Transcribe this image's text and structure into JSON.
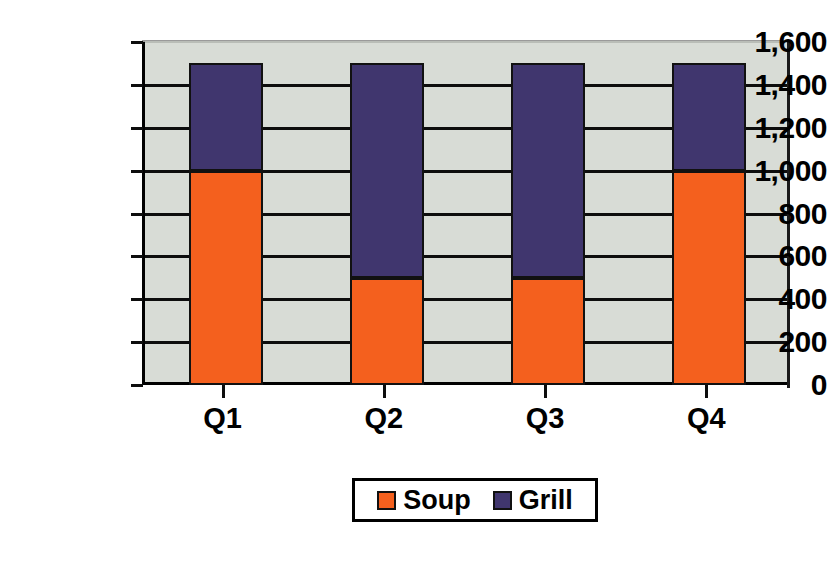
{
  "chart_data": {
    "type": "bar",
    "subtype": "stacked-column",
    "title": "",
    "xlabel": "",
    "ylabel": "",
    "categories": [
      "Q1",
      "Q2",
      "Q3",
      "Q4"
    ],
    "series": [
      {
        "name": "Soup",
        "color": "#f4601e",
        "values": [
          1000,
          500,
          500,
          1000
        ]
      },
      {
        "name": "Grill",
        "color": "#40366e",
        "values": [
          500,
          1000,
          1000,
          500
        ]
      }
    ],
    "totals": [
      1500,
      1500,
      1500,
      1500
    ],
    "ylim": [
      0,
      1600
    ],
    "ytick_step": 200,
    "ytick_labels": [
      "1,600",
      "1,400",
      "1,200",
      "1,000",
      "800",
      "600",
      "400",
      "200",
      "0"
    ],
    "ytick_values": [
      1600,
      1400,
      1200,
      1000,
      800,
      600,
      400,
      200,
      0
    ],
    "grid": true,
    "legend_position": "bottom",
    "legend_entries": [
      "Soup",
      "Grill"
    ],
    "plot_background": "#d8dcd6",
    "axis_color": "#000000"
  },
  "legend": {
    "items": [
      {
        "label": "Soup",
        "swatch": "#f4601e"
      },
      {
        "label": "Grill",
        "swatch": "#40366e"
      }
    ]
  }
}
